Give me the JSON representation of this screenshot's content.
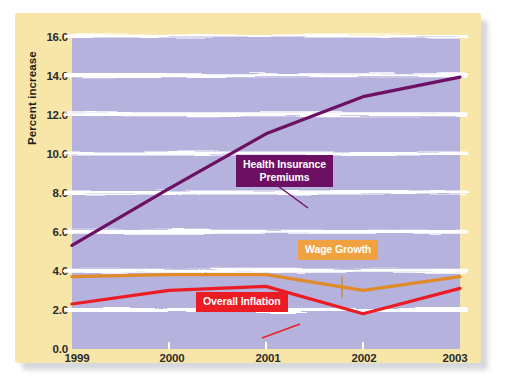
{
  "chart_data": {
    "type": "line",
    "title": "",
    "xlabel": "",
    "ylabel": "Percent increase",
    "x": [
      1999,
      2000,
      2001,
      2002,
      2003
    ],
    "categories": [
      "1999",
      "2000",
      "2001",
      "2002",
      "2003"
    ],
    "xtick_labels": [
      "1999",
      "2000",
      "2001",
      "2002",
      "2003"
    ],
    "ytick_labels": [
      "16.0",
      "14.0",
      "12.0",
      "10.0",
      "8.0",
      "6.0",
      "4.0",
      "2.0",
      "0.0"
    ],
    "ytick_values": [
      16.0,
      14.0,
      12.0,
      10.0,
      8.0,
      6.0,
      4.0,
      2.0,
      0.0
    ],
    "ylim": [
      0.0,
      16.0
    ],
    "xlim": [
      1999,
      2003
    ],
    "grid": true,
    "grid_style": "horizontal white wavy bands",
    "legend_position": "inline-callouts",
    "series": [
      {
        "name": "Health Insurance Premiums",
        "label": "Health Insurance\nPremiums",
        "color": "#6d1063",
        "values": [
          5.3,
          8.2,
          11.0,
          12.9,
          13.9
        ]
      },
      {
        "name": "Wage Growth",
        "label": "Wage Growth",
        "color": "#e08b28",
        "values": [
          3.7,
          3.8,
          3.8,
          3.0,
          3.7
        ]
      },
      {
        "name": "Overall Inflation",
        "label": "Overall Inflation",
        "color": "#ec1c24",
        "values": [
          2.3,
          3.0,
          3.2,
          1.8,
          3.1
        ]
      }
    ]
  },
  "style": {
    "card_background": "#f8e6a8",
    "plot_background": "#b5b2dd",
    "gridline_color": "#ffffff",
    "axis_text_color": "#2b2b2b",
    "page_background": "#ffffff",
    "premiums_color": "#6d1063",
    "wage_color": "#e08b28",
    "inflation_color": "#ec1c24"
  }
}
